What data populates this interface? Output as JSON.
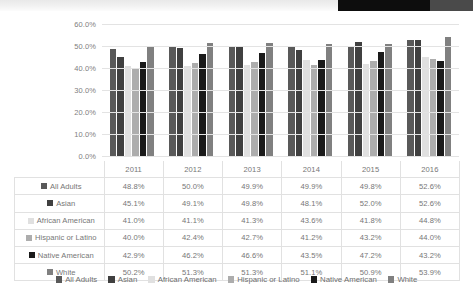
{
  "chart_data": {
    "type": "bar",
    "title": "",
    "xlabel": "",
    "ylabel": "",
    "categories": [
      "2011",
      "2012",
      "2013",
      "2014",
      "2015",
      "2016"
    ],
    "ylim": [
      0,
      60
    ],
    "y_ticks": [
      "0.0%",
      "10.0%",
      "20.0%",
      "30.0%",
      "40.0%",
      "50.0%",
      "60.0%"
    ],
    "y_tick_values": [
      0,
      10,
      20,
      30,
      40,
      50,
      60
    ],
    "grid": true,
    "legend_position": "bottom",
    "value_suffix": "%",
    "series": [
      {
        "name": "All Adults",
        "color": "#595959",
        "values": [
          48.8,
          50.0,
          49.9,
          49.9,
          49.8,
          52.6
        ],
        "labels": [
          "48.8%",
          "50.0%",
          "49.9%",
          "49.9%",
          "49.8%",
          "52.6%"
        ]
      },
      {
        "name": "Asian",
        "color": "#404040",
        "values": [
          45.1,
          49.1,
          49.8,
          48.1,
          52.0,
          52.6
        ],
        "labels": [
          "45.1%",
          "49.1%",
          "49.8%",
          "48.1%",
          "52.0%",
          "52.6%"
        ]
      },
      {
        "name": "African American",
        "color": "#e0e0e0",
        "values": [
          41.0,
          41.1,
          41.3,
          43.6,
          41.8,
          44.8
        ],
        "labels": [
          "41.0%",
          "41.1%",
          "41.3%",
          "43.6%",
          "41.8%",
          "44.8%"
        ]
      },
      {
        "name": "Hispanic or Latino",
        "color": "#adadad",
        "values": [
          40.0,
          42.4,
          42.7,
          41.2,
          43.2,
          44.0
        ],
        "labels": [
          "40.0%",
          "42.4%",
          "42.7%",
          "41.2%",
          "43.2%",
          "44.0%"
        ]
      },
      {
        "name": "Native American",
        "color": "#1a1a1a",
        "values": [
          42.9,
          46.2,
          46.6,
          43.5,
          47.2,
          43.2
        ],
        "labels": [
          "42.9%",
          "46.2%",
          "46.6%",
          "43.5%",
          "47.2%",
          "43.2%"
        ]
      },
      {
        "name": "White",
        "color": "#808080",
        "values": [
          50.2,
          51.3,
          51.3,
          51.1,
          50.9,
          53.9
        ],
        "labels": [
          "50.2%",
          "51.3%",
          "51.3%",
          "51.1%",
          "50.9%",
          "53.9%"
        ]
      }
    ]
  },
  "table": {
    "corner_label": "",
    "column_headers": [
      "2011",
      "2012",
      "2013",
      "2014",
      "2015",
      "2016"
    ],
    "rows": [
      {
        "label": "All Adults",
        "color": "#595959",
        "values": [
          "48.8%",
          "50.0%",
          "49.9%",
          "49.9%",
          "49.8%",
          "52.6%"
        ]
      },
      {
        "label": "Asian",
        "color": "#404040",
        "values": [
          "45.1%",
          "49.1%",
          "49.8%",
          "48.1%",
          "52.0%",
          "52.6%"
        ]
      },
      {
        "label": "African American",
        "color": "#e0e0e0",
        "values": [
          "41.0%",
          "41.1%",
          "41.3%",
          "43.6%",
          "41.8%",
          "44.8%"
        ]
      },
      {
        "label": "Hispanic or Latino",
        "color": "#adadad",
        "values": [
          "40.0%",
          "42.4%",
          "42.7%",
          "41.2%",
          "43.2%",
          "44.0%"
        ]
      },
      {
        "label": "Native American",
        "color": "#1a1a1a",
        "values": [
          "42.9%",
          "46.2%",
          "46.6%",
          "43.5%",
          "47.2%",
          "43.2%"
        ]
      },
      {
        "label": "White",
        "color": "#808080",
        "values": [
          "50.2%",
          "51.3%",
          "51.3%",
          "51.1%",
          "50.9%",
          "53.9%"
        ]
      }
    ]
  },
  "legend": {
    "items": [
      {
        "label": "All Adults",
        "color": "#595959"
      },
      {
        "label": "Asian",
        "color": "#404040"
      },
      {
        "label": "African American",
        "color": "#e0e0e0"
      },
      {
        "label": "Hispanic or Latino",
        "color": "#adadad"
      },
      {
        "label": "Native American",
        "color": "#1a1a1a"
      },
      {
        "label": "White",
        "color": "#808080"
      }
    ]
  },
  "top_band": {
    "accent_color": "#0d0d0d",
    "accent_color_2": "#4a4a4a",
    "band_color": "#eeeeee"
  }
}
